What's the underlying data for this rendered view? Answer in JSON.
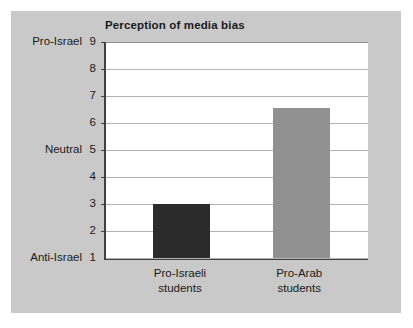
{
  "panel": {
    "background_color": "#c9c9c9",
    "page_background_color": "#ffffff"
  },
  "chart_data": {
    "type": "bar",
    "title": "Perception of media bias",
    "xlabel": "",
    "ylabel": "",
    "categories": [
      "Pro-Israeli students",
      "Pro-Arab students"
    ],
    "category_lines": [
      [
        "Pro-Israeli",
        "students"
      ],
      [
        "Pro-Arab",
        "students"
      ]
    ],
    "values": [
      3.0,
      6.55
    ],
    "bar_colors": [
      "#2b2b2b",
      "#919191"
    ],
    "ylim": [
      1,
      9
    ],
    "yticks": [
      1,
      2,
      3,
      4,
      5,
      6,
      7,
      8,
      9
    ],
    "ytick_labels": [
      "1",
      "2",
      "3",
      "4",
      "5",
      "6",
      "7",
      "8",
      "9"
    ],
    "y_named_ticks": [
      {
        "value": 9,
        "label": "Pro-Israel"
      },
      {
        "value": 5,
        "label": "Neutral"
      },
      {
        "value": 1,
        "label": "Anti-Israel"
      }
    ],
    "grid": true,
    "grid_color": "#b4b4b4",
    "axis_color": "#404040",
    "plot_background": "#ffffff",
    "legend": null
  }
}
